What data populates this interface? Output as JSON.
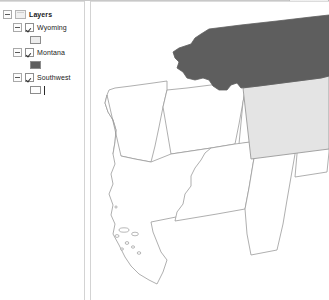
{
  "window": {
    "title": "GIS Map View",
    "accent_color": "#5e5e5e"
  },
  "toc": {
    "root": {
      "label": "Layers",
      "expander": "minus-box",
      "icon": "layers-icon"
    },
    "items": [
      {
        "label": "Wyoming",
        "checked": true,
        "expander": "minus-box",
        "symbol": {
          "name": "polygon-swatch-light-gray",
          "fill": "#ededed",
          "outline": "#8c8c8c"
        }
      },
      {
        "label": "Montana",
        "checked": true,
        "expander": "minus-box",
        "symbol": {
          "name": "polygon-swatch-dark-gray",
          "fill": "#5e5e5e",
          "outline": "#8c8c8c"
        }
      },
      {
        "label": "Southwest",
        "checked": true,
        "expander": "minus-box",
        "symbol": {
          "name": "polygon-swatch-white",
          "fill": "#fdfdfd",
          "outline": "#8c8c8c"
        },
        "caret_visible": true
      }
    ]
  },
  "map": {
    "background": "#ffffff",
    "outline_color": "#9a9a9a",
    "layers": [
      {
        "name": "montana",
        "label": "Montana",
        "fill": "#5e5e5e",
        "stroke": "#5e5e5e"
      },
      {
        "name": "wyoming",
        "label": "Wyoming",
        "fill": "#e4e4e4",
        "stroke": "#9a9a9a"
      },
      {
        "name": "southwest",
        "label": "Southwest",
        "fill": "#ffffff",
        "stroke": "#9a9a9a",
        "features": [
          "oregon-idaho",
          "california",
          "nevada",
          "utah",
          "arizona",
          "new-mexico",
          "colorado",
          "channel-islands"
        ]
      }
    ]
  },
  "splitter": {
    "name": "panel-splitter",
    "orientation": "vertical"
  }
}
